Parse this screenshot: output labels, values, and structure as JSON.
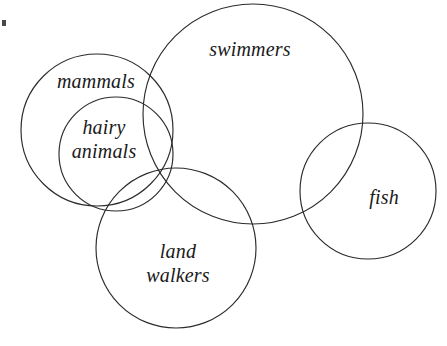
{
  "diagram": {
    "background_color": "#ffffff",
    "stroke_color": "#2b2b2b",
    "text_color": "#1a1a1a",
    "width": 447,
    "height": 346
  },
  "chart_data": {
    "type": "venn",
    "title": "",
    "xlabel": "",
    "ylabel": "",
    "sets": [
      {
        "name": "mammals",
        "label": "mammals",
        "cx": 97,
        "cy": 130,
        "r": 76,
        "label_x": 96,
        "label_y": 82
      },
      {
        "name": "hairy animals",
        "label": "hairy animals",
        "label_line_1": "hairy",
        "label_line_2": "animals",
        "cx": 116,
        "cy": 154,
        "r": 57,
        "label_x": 104,
        "label_y": 140
      },
      {
        "name": "swimmers",
        "label": "swimmers",
        "cx": 253,
        "cy": 114,
        "r": 110,
        "label_x": 250,
        "label_y": 50
      },
      {
        "name": "land walkers",
        "label": "land walkers",
        "label_line_1": "land",
        "label_line_2": "walkers",
        "cx": 176,
        "cy": 248,
        "r": 80,
        "label_x": 178,
        "label_y": 264
      },
      {
        "name": "fish",
        "label": "fish",
        "cx": 368,
        "cy": 191,
        "r": 68,
        "label_x": 384,
        "label_y": 198
      }
    ],
    "relations": [
      "hairy animals is fully contained within mammals",
      "mammals overlaps swimmers",
      "mammals overlaps land walkers",
      "hairy animals overlaps swimmers",
      "hairy animals overlaps land walkers",
      "swimmers overlaps land walkers",
      "swimmers overlaps fish",
      "fish does not overlap mammals, hairy animals, or land walkers"
    ]
  }
}
